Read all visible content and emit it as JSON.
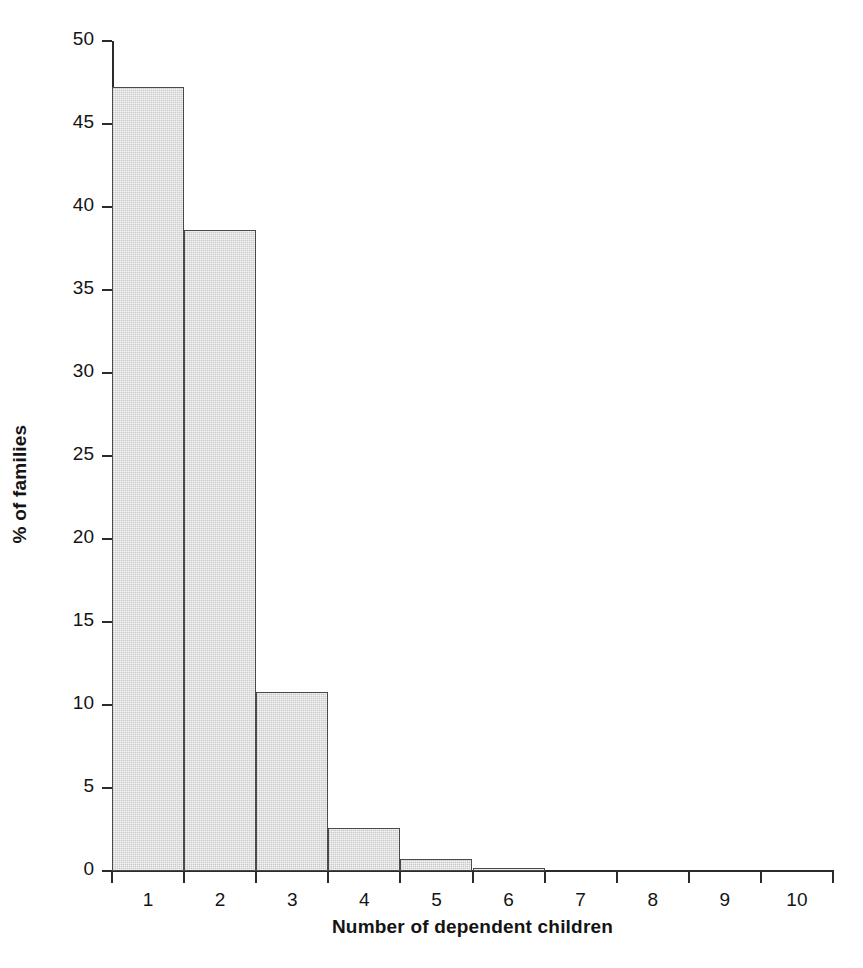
{
  "chart_data": {
    "type": "bar",
    "title": "",
    "subtitle": "",
    "xlabel": "Number of dependent children",
    "ylabel": "% of families",
    "categories": [
      "1",
      "2",
      "3",
      "4",
      "5",
      "6",
      "7",
      "8",
      "9",
      "10"
    ],
    "values": [
      47.2,
      38.6,
      10.8,
      2.6,
      0.7,
      0.2,
      0.0,
      0.0,
      0.0,
      0.0
    ],
    "ylim": [
      0,
      50
    ],
    "ytick_labels": [
      "0",
      "5",
      "10",
      "15",
      "20",
      "25",
      "30",
      "35",
      "40",
      "45",
      "50"
    ],
    "ytick_values": [
      0,
      5,
      10,
      15,
      20,
      25,
      30,
      35,
      40,
      45,
      50
    ],
    "xtick_labels": [
      "1",
      "2",
      "3",
      "4",
      "5",
      "6",
      "7",
      "8",
      "9",
      "10"
    ],
    "xlim": [
      0.5,
      10.5
    ],
    "grid": false,
    "legend": false,
    "legend_position": "none",
    "bar_fill_color": "#d9d9d9",
    "bar_edge_color": "#4a4a4a",
    "axis_color": "#2b2b2b",
    "background_color": "#ffffff"
  }
}
